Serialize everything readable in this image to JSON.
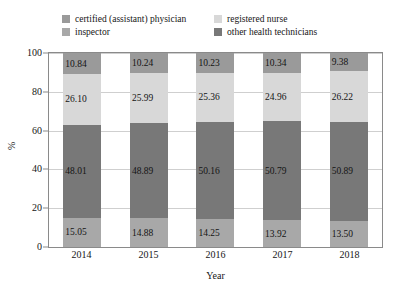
{
  "chart_data": {
    "type": "bar",
    "stacked": true,
    "normalized_percent": true,
    "title": "",
    "xlabel": "Year",
    "ylabel": "%",
    "categories": [
      "2014",
      "2015",
      "2016",
      "2017",
      "2018"
    ],
    "ylim": [
      0,
      100
    ],
    "yticks": [
      0,
      20,
      40,
      60,
      80,
      100
    ],
    "ytick_labels": [
      "0",
      "20",
      "40",
      "60",
      "80",
      "100"
    ],
    "grid": "horizontal",
    "legend_position": "top",
    "stack_order_bottom_to_top": [
      "inspector",
      "other health technicians",
      "registered nurse",
      "certified (assistant) physician"
    ],
    "series": [
      {
        "name": "certified (assistant) physician",
        "color": "#9a9a9a",
        "values": [
          10.84,
          10.24,
          10.23,
          10.34,
          9.38
        ],
        "labels": [
          "10.84",
          "10.24",
          "10.23",
          "10.34",
          "9.38"
        ]
      },
      {
        "name": "registered nurse",
        "color": "#d8d8d8",
        "values": [
          26.1,
          25.99,
          25.36,
          24.96,
          26.22
        ],
        "labels": [
          "26.10",
          "25.99",
          "25.36",
          "24.96",
          "26.22"
        ]
      },
      {
        "name": "other health technicians",
        "color": "#787878",
        "values": [
          48.01,
          48.89,
          50.16,
          50.79,
          50.89
        ],
        "labels": [
          "48.01",
          "48.89",
          "50.16",
          "50.79",
          "50.89"
        ]
      },
      {
        "name": "inspector",
        "color": "#a8a8a8",
        "values": [
          15.05,
          14.88,
          14.25,
          13.92,
          13.5
        ],
        "labels": [
          "15.05",
          "14.88",
          "14.25",
          "13.92",
          "13.50"
        ]
      }
    ]
  },
  "legend": {
    "entries": [
      {
        "label": "certified (assistant) physician",
        "color": "#9a9a9a"
      },
      {
        "label": "registered nurse",
        "color": "#d8d8d8"
      },
      {
        "label": "inspector",
        "color": "#a8a8a8"
      },
      {
        "label": "other health technicians",
        "color": "#787878"
      }
    ]
  },
  "axes": {
    "y_title": "%",
    "x_title": "Year"
  }
}
